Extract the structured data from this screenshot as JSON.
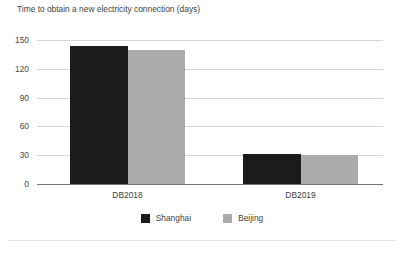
{
  "chart_data": {
    "type": "bar",
    "title": "Time to obtain a new electricity connection (days)",
    "xlabel": "",
    "ylabel": "",
    "categories": [
      "DB2018",
      "DB2019"
    ],
    "series": [
      {
        "name": "Shanghai",
        "color": "#1b1b1b",
        "values": [
          144,
          31
        ]
      },
      {
        "name": "Beijing",
        "color": "#ababab",
        "values": [
          140,
          30
        ]
      }
    ],
    "ylim": [
      0,
      150
    ],
    "yticks": [
      0,
      30,
      60,
      90,
      120,
      150
    ],
    "ytick_labels": [
      "0",
      "30",
      "60",
      "90",
      "120",
      "150"
    ],
    "grid": true,
    "grid_axis": "y",
    "legend_position": "bottom",
    "bar_grouping": "adjacent-touching"
  },
  "legend": {
    "items": [
      {
        "label": "Shanghai",
        "color": "#1b1b1b"
      },
      {
        "label": "Beijing",
        "color": "#ababab"
      }
    ]
  }
}
